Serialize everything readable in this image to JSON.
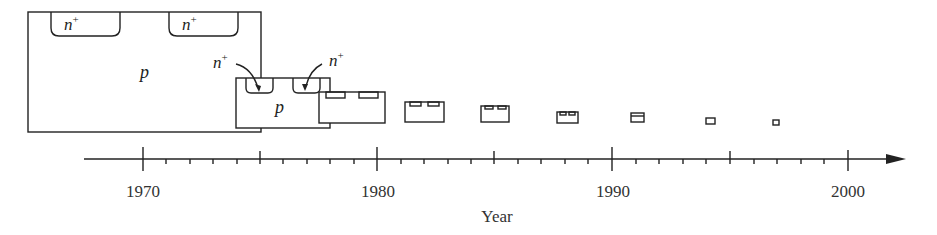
{
  "figure": {
    "axis": {
      "title": "Year",
      "tick_labels": [
        "1970",
        "1980",
        "1990",
        "2000"
      ],
      "major_years": [
        1970,
        1975,
        1980,
        1985,
        1990,
        1995,
        2000
      ],
      "minor_step_years": 1
    },
    "labels": {
      "substrate": "p",
      "diffusion": "n",
      "diffusion_superscript": "+"
    },
    "devices": [
      {
        "year": 1970,
        "size": "largest"
      },
      {
        "year": 1977,
        "size": "large"
      },
      {
        "year": 1979.5,
        "size": "medium"
      },
      {
        "year": 1982,
        "size": "small"
      },
      {
        "year": 1985,
        "size": "small"
      },
      {
        "year": 1988,
        "size": "smaller"
      },
      {
        "year": 1991,
        "size": "smaller"
      },
      {
        "year": 1994,
        "size": "tiny"
      },
      {
        "year": 1997,
        "size": "tiny"
      }
    ]
  }
}
